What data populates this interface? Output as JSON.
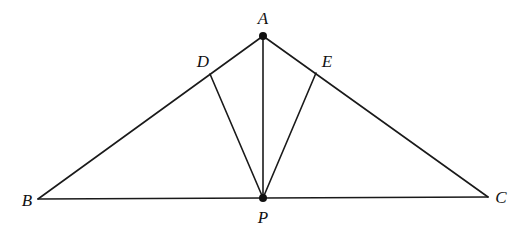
{
  "diagram": {
    "type": "geometry",
    "points": {
      "A": {
        "x": 263,
        "y": 36,
        "label": "A",
        "lx": 263,
        "ly": 24,
        "dot": true
      },
      "B": {
        "x": 38,
        "y": 199,
        "label": "B",
        "lx": 27,
        "ly": 206,
        "dot": false
      },
      "C": {
        "x": 488,
        "y": 197,
        "label": "C",
        "lx": 501,
        "ly": 203,
        "dot": false
      },
      "P": {
        "x": 263,
        "y": 198,
        "label": "P",
        "lx": 263,
        "ly": 223,
        "dot": true
      },
      "D": {
        "x": 210,
        "y": 74,
        "label": "D",
        "lx": 203,
        "ly": 67,
        "dot": false
      },
      "E": {
        "x": 316,
        "y": 73,
        "label": "E",
        "lx": 327,
        "ly": 67,
        "dot": false
      }
    },
    "segments": [
      [
        "A",
        "B"
      ],
      [
        "A",
        "C"
      ],
      [
        "B",
        "C"
      ],
      [
        "A",
        "P"
      ],
      [
        "P",
        "D"
      ],
      [
        "P",
        "E"
      ]
    ],
    "labels": {
      "A": "A",
      "B": "B",
      "C": "C",
      "D": "D",
      "E": "E",
      "P": "P"
    },
    "colors": {
      "line": "#1a1a1a",
      "background": "#ffffff"
    }
  }
}
